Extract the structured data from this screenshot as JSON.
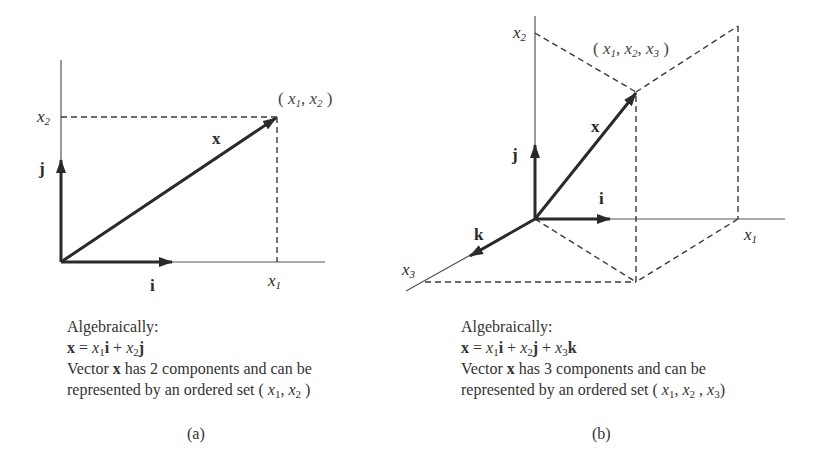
{
  "figure_a": {
    "axis_labels": {
      "x1": "x",
      "x1_sub": "1",
      "x2": "x",
      "x2_sub": "2"
    },
    "unit_vectors": {
      "i": "i",
      "j": "j"
    },
    "vector_label": "x",
    "point_label": {
      "open": "( ",
      "v1": "x",
      "s1": "1",
      "sep": ", ",
      "v2": "x",
      "s2": "2",
      "close": " )"
    },
    "caption": {
      "line1": "Algebraically:",
      "eq": {
        "lhs": "x",
        "eqsign": " = ",
        "t1v": "x",
        "t1s": "1",
        "t1u": "i",
        "plus1": " + ",
        "t2v": "x",
        "t2s": "2",
        "t2u": "j"
      },
      "line3_pre": "Vector ",
      "line3_bold": "x",
      "line3_post": " has 2 components and can be",
      "line4_pre": "represented by an ordered set ( ",
      "line4_v1": "x",
      "line4_s1": "1",
      "line4_sep": ", ",
      "line4_v2": "x",
      "line4_s2": "2",
      "line4_close": " )"
    },
    "sublabel": "(a)"
  },
  "figure_b": {
    "axis_labels": {
      "x1": "x",
      "x1_sub": "1",
      "x2": "x",
      "x2_sub": "2",
      "x3": "x",
      "x3_sub": "3"
    },
    "unit_vectors": {
      "i": "i",
      "j": "j",
      "k": "k"
    },
    "vector_label": "x",
    "point_label": {
      "open": "( ",
      "v1": "x",
      "s1": "1",
      "sep1": ", ",
      "v2": "x",
      "s2": "2",
      "sep2": ", ",
      "v3": "x",
      "s3": "3",
      "close": " )"
    },
    "caption": {
      "line1": "Algebraically:",
      "eq": {
        "lhs": "x",
        "eqsign": " = ",
        "t1v": "x",
        "t1s": "1",
        "t1u": "i",
        "plus1": " + ",
        "t2v": "x",
        "t2s": "2",
        "t2u": "j",
        "plus2": " + ",
        "t3v": "x",
        "t3s": "3",
        "t3u": "k"
      },
      "line3_pre": "Vector ",
      "line3_bold": "x",
      "line3_post": " has 3 components and can be",
      "line4_pre": "represented by an ordered set ( ",
      "line4_v1": "x",
      "line4_s1": "1",
      "line4_sep1": ", ",
      "line4_v2": "x",
      "line4_s2": "2",
      "line4_sep2": " , ",
      "line4_v3": "x",
      "line4_s3": "3",
      "line4_close": ")"
    },
    "sublabel": "(b)"
  },
  "colors": {
    "ink": "#2a2a2a",
    "axis": "#555555",
    "dash": "#3a3a3a"
  }
}
